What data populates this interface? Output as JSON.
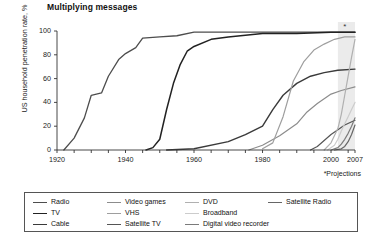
{
  "chart_data": {
    "type": "line",
    "title": "Multiplying messages",
    "xlabel": "",
    "ylabel": "US household penetration rate, %",
    "xlim": [
      1920,
      2007
    ],
    "ylim": [
      0,
      100
    ],
    "grid": false,
    "legend_position": "bottom",
    "xticks": [
      1920,
      1940,
      1960,
      1980,
      2000,
      2007
    ],
    "yticks": [
      0,
      20,
      40,
      60,
      80,
      100
    ],
    "xtick_labels": [
      "1920",
      "1940",
      "1960",
      "1980",
      "2000",
      "2007"
    ],
    "ytick_labels": [
      "0",
      "20",
      "40",
      "60",
      "80",
      "100"
    ],
    "annotations": [
      {
        "text": "*Projections",
        "x": 2003,
        "y": -14
      },
      {
        "text": "*",
        "x": 2004,
        "y": 104
      }
    ],
    "projection_band": {
      "start": 2002,
      "end": 2007,
      "label": "*"
    },
    "series": [
      {
        "name": "Radio",
        "color": "#4d4d4d",
        "width": 1.3,
        "points": [
          [
            1922,
            0
          ],
          [
            1925,
            10
          ],
          [
            1928,
            27
          ],
          [
            1930,
            46
          ],
          [
            1933,
            48
          ],
          [
            1935,
            62
          ],
          [
            1938,
            76
          ],
          [
            1940,
            81
          ],
          [
            1943,
            86
          ],
          [
            1945,
            94
          ],
          [
            1950,
            95
          ],
          [
            1955,
            96
          ],
          [
            1960,
            99
          ],
          [
            1980,
            99
          ],
          [
            2007,
            99
          ]
        ]
      },
      {
        "name": "TV",
        "color": "#222222",
        "width": 1.5,
        "points": [
          [
            1946,
            0
          ],
          [
            1948,
            2
          ],
          [
            1950,
            9
          ],
          [
            1952,
            34
          ],
          [
            1954,
            56
          ],
          [
            1956,
            72
          ],
          [
            1958,
            83
          ],
          [
            1960,
            87
          ],
          [
            1965,
            93
          ],
          [
            1970,
            95
          ],
          [
            1980,
            98
          ],
          [
            1990,
            98
          ],
          [
            2000,
            99
          ],
          [
            2007,
            99
          ]
        ]
      },
      {
        "name": "Cable",
        "color": "#3a3a3a",
        "width": 1.4,
        "points": [
          [
            1952,
            0
          ],
          [
            1960,
            1
          ],
          [
            1970,
            7
          ],
          [
            1975,
            13
          ],
          [
            1980,
            20
          ],
          [
            1983,
            34
          ],
          [
            1986,
            46
          ],
          [
            1990,
            56
          ],
          [
            1994,
            62
          ],
          [
            1998,
            65
          ],
          [
            2002,
            67
          ],
          [
            2007,
            68
          ]
        ]
      },
      {
        "name": "Video games",
        "color": "#8c8c8c",
        "width": 1.2,
        "points": [
          [
            1976,
            0
          ],
          [
            1980,
            4
          ],
          [
            1985,
            12
          ],
          [
            1990,
            22
          ],
          [
            1993,
            32
          ],
          [
            1996,
            39
          ],
          [
            2000,
            47
          ],
          [
            2003,
            50
          ],
          [
            2007,
            53
          ]
        ]
      },
      {
        "name": "VHS",
        "color": "#9e9e9e",
        "width": 1.2,
        "points": [
          [
            1980,
            1
          ],
          [
            1983,
            6
          ],
          [
            1986,
            28
          ],
          [
            1989,
            58
          ],
          [
            1992,
            74
          ],
          [
            1995,
            84
          ],
          [
            1998,
            89
          ],
          [
            2001,
            93
          ],
          [
            2004,
            95
          ],
          [
            2007,
            95
          ]
        ]
      },
      {
        "name": "Satellite TV",
        "color": "#555555",
        "width": 1.2,
        "points": [
          [
            1994,
            0
          ],
          [
            1996,
            3
          ],
          [
            1998,
            8
          ],
          [
            2000,
            13
          ],
          [
            2002,
            17
          ],
          [
            2004,
            21
          ],
          [
            2007,
            25
          ]
        ]
      },
      {
        "name": "DVD",
        "color": "#b0b0b0",
        "width": 1.2,
        "points": [
          [
            1998,
            0
          ],
          [
            2000,
            6
          ],
          [
            2002,
            18
          ],
          [
            2003,
            30
          ],
          [
            2004,
            46
          ],
          [
            2005,
            62
          ],
          [
            2006,
            78
          ],
          [
            2007,
            93
          ]
        ]
      },
      {
        "name": "Broadband",
        "color": "#cccccc",
        "width": 1.2,
        "points": [
          [
            1999,
            0
          ],
          [
            2001,
            4
          ],
          [
            2002,
            9
          ],
          [
            2003,
            16
          ],
          [
            2004,
            22
          ],
          [
            2005,
            28
          ],
          [
            2006,
            34
          ],
          [
            2007,
            40
          ]
        ]
      },
      {
        "name": "Digital video recorder",
        "color": "#7a7a7a",
        "width": 1.2,
        "points": [
          [
            2000,
            0
          ],
          [
            2002,
            2
          ],
          [
            2003,
            5
          ],
          [
            2004,
            9
          ],
          [
            2005,
            14
          ],
          [
            2006,
            20
          ],
          [
            2007,
            27
          ]
        ]
      },
      {
        "name": "Satellite Radio",
        "color": "#666666",
        "width": 1.2,
        "points": [
          [
            2001,
            0
          ],
          [
            2003,
            1
          ],
          [
            2004,
            3
          ],
          [
            2005,
            7
          ],
          [
            2006,
            13
          ],
          [
            2007,
            21
          ]
        ]
      }
    ]
  },
  "legend": {
    "columns": [
      [
        {
          "label": "Radio",
          "color": "#4d4d4d",
          "width": 1.6
        },
        {
          "label": "TV",
          "color": "#222222",
          "width": 1.8
        },
        {
          "label": "Cable",
          "color": "#3a3a3a",
          "width": 1.7
        }
      ],
      [
        {
          "label": "Video games",
          "color": "#8c8c8c",
          "width": 1.4
        },
        {
          "label": "VHS",
          "color": "#9e9e9e",
          "width": 1.4
        },
        {
          "label": "Satellite TV",
          "color": "#555555",
          "width": 1.6
        }
      ],
      [
        {
          "label": "DVD",
          "color": "#b0b0b0",
          "width": 1.4
        },
        {
          "label": "Broadband",
          "color": "#cccccc",
          "width": 1.4
        },
        {
          "label": "Digital video recorder",
          "color": "#7a7a7a",
          "width": 1.5
        }
      ],
      [
        {
          "label": "Satellite Radio",
          "color": "#666666",
          "width": 1.5
        }
      ]
    ]
  },
  "footer": {
    "source": ""
  },
  "colors": {
    "axis": "#333333",
    "text": "#1a1a1a",
    "projection_band": "#ebebeb"
  }
}
